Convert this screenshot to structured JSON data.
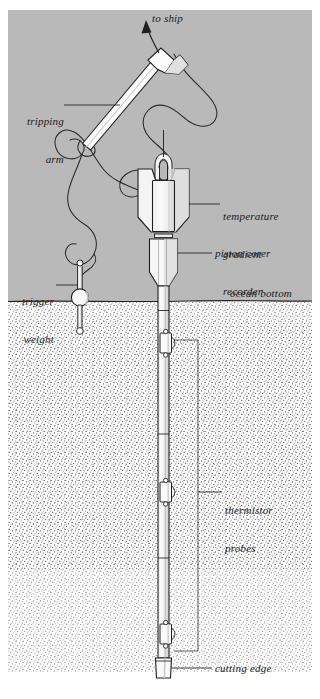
{
  "figure": {
    "domain": "Diagram",
    "background_color": "#ffffff",
    "water_color": "#b9b9b9",
    "sediment_color": "#fdfdfd",
    "stipple_color": "#4a4a4a",
    "line_color": "#1a1a1a",
    "metal_fill": "#f6f6f6",
    "metal_shade": "#d6d6d6"
  },
  "labels": {
    "to_ship": "to ship",
    "tripping_arm_l1": "tripping",
    "tripping_arm_l2": "arm",
    "trigger_weight_l1": "trigger",
    "trigger_weight_l2": "weight",
    "temperature_recorder_l1": "temperature",
    "temperature_recorder_l2": "gradient",
    "temperature_recorder_l3": "recorder",
    "piston_corer": "piston corer",
    "ocean_bottom": "ocean bottom",
    "thermistor_probes_l1": "thermistor",
    "thermistor_probes_l2": "probes",
    "cutting_edge": "cutting edge"
  },
  "regions": {
    "water_top_y": 0,
    "ocean_bottom_y": 290,
    "sediment_bottom_y": 660
  },
  "components": {
    "tripping_arm": "angled bar with trip weight head at upper end",
    "recorder": "notched-shoulder pressure case with lifting bail",
    "corer": "weight stand tapering to core barrel",
    "probe_count": 3,
    "cutting_edge": "core catcher nose at barrel foot"
  }
}
